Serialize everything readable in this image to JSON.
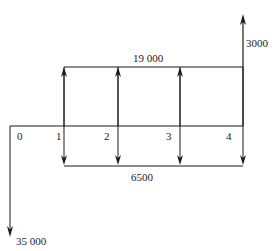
{
  "diagram": {
    "type": "cash-flow",
    "period_labels": [
      "0",
      "1",
      "2",
      "3",
      "4"
    ],
    "inflow_annual": {
      "label": "19 000",
      "periods": [
        1,
        2,
        3,
        4
      ]
    },
    "outflow_annual": {
      "label": "6500",
      "periods": [
        1,
        2,
        3,
        4
      ]
    },
    "salvage_inflow": {
      "label": "3000",
      "period": 4
    },
    "initial_outflow": {
      "label": "35 000",
      "period": 0
    },
    "colors": {
      "line": "#1a1a1a",
      "background": "#ffffff"
    }
  }
}
